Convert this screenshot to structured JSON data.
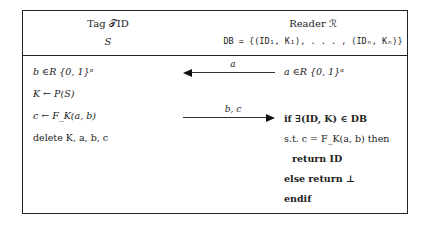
{
  "header": {
    "tag_title": "Tag 𝒯ID",
    "tag_state": "S",
    "reader_title": "Reader ℛ",
    "reader_state": "DB = {(ID₁, K₁), . . . , (IDₙ, Kₙ)}"
  },
  "tag_steps": [
    "b ∈R {0, 1}ᵅ",
    "K ← P(S)",
    "c ← F_K(a, b)",
    "delete K, a, b, c"
  ],
  "reader_steps": [
    "a ∈R {0, 1}ᵅ",
    "if ∃(ID, K) ∈ DB",
    "s.t. c = F_K(a, b) then",
    "return ID",
    "else return ⊥",
    "endif"
  ],
  "messages": [
    {
      "label": "a",
      "direction": "reader-to-tag"
    },
    {
      "label": "b, c",
      "direction": "tag-to-reader"
    }
  ]
}
